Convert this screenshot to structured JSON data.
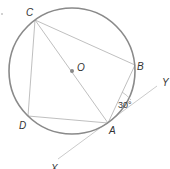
{
  "diagram": {
    "type": "circle-geometry",
    "circle": {
      "center_label": "O",
      "stroke": "#8a8a8a"
    },
    "points": {
      "A": "A",
      "B": "B",
      "C": "C",
      "D": "D",
      "O": "O",
      "X": "X",
      "Y": "Y"
    },
    "tangent": {
      "from": "X",
      "to": "Y",
      "through": "A"
    },
    "chords": [
      "CB",
      "BA",
      "AD",
      "DC",
      "CA"
    ],
    "angle": {
      "label": "30°",
      "between": [
        "BA",
        "AY"
      ]
    },
    "colors": {
      "circle": "#8a8a8a",
      "lines": "#b5b5b5",
      "text": "#333333",
      "center_dot": "#8a8a8a"
    }
  }
}
